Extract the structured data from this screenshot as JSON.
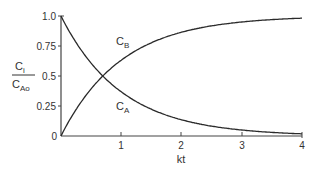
{
  "chart_data": {
    "type": "line",
    "title": "",
    "xlabel": "kt",
    "ylabel": "C_i / C_Ao",
    "ylabel_parts": {
      "num_main": "C",
      "num_sub": "i",
      "den_main": "C",
      "den_sub": "Ao"
    },
    "xlim": [
      0,
      4
    ],
    "ylim": [
      0,
      1.0
    ],
    "x_ticks": [
      "1",
      "2",
      "3",
      "4"
    ],
    "y_ticks": [
      "0",
      "0.25",
      "0.5",
      "0.75",
      "1.0"
    ],
    "grid": false,
    "legend": "none (inline curve labels)",
    "x": [
      0,
      0.25,
      0.5,
      0.693,
      1.0,
      1.5,
      2.0,
      2.5,
      3.0,
      3.5,
      4.0
    ],
    "series": [
      {
        "name": "C_A",
        "label_main": "C",
        "label_sub": "A",
        "values": [
          1.0,
          0.779,
          0.607,
          0.5,
          0.368,
          0.223,
          0.135,
          0.082,
          0.05,
          0.03,
          0.018
        ]
      },
      {
        "name": "C_B",
        "label_main": "C",
        "label_sub": "B",
        "values": [
          0.0,
          0.221,
          0.393,
          0.5,
          0.632,
          0.777,
          0.865,
          0.918,
          0.95,
          0.97,
          0.982
        ]
      }
    ],
    "annotations": [
      "Curves intersect at kt ≈ 0.69, C_i/C_Ao = 0.5"
    ]
  },
  "colors": {
    "line": "#2a2a2a",
    "axis": "#444444",
    "text": "#333333"
  }
}
